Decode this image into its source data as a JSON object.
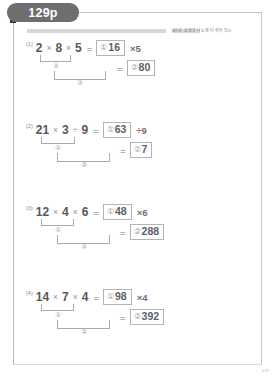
{
  "page": {
    "tab_label": "129p",
    "header_label": "3단원 곱셈과 나눗셈이 섞여 있는 식",
    "page_number": "129"
  },
  "problems": [
    {
      "number": "(1)",
      "terms": [
        "2",
        "8",
        "5"
      ],
      "operators": [
        "×",
        "×"
      ],
      "line1": {
        "equals": "=",
        "marker": "①",
        "answer": "16",
        "tail": "×5"
      },
      "line2": {
        "equals": "=",
        "marker": "②",
        "answer": "80"
      },
      "bracket_inner_label": "①",
      "bracket_outer_label": "②"
    },
    {
      "number": "(2)",
      "terms": [
        "21",
        "3",
        "9"
      ],
      "operators": [
        "×",
        "÷"
      ],
      "line1": {
        "equals": "=",
        "marker": "①",
        "answer": "63",
        "tail": "÷9"
      },
      "line2": {
        "equals": "=",
        "marker": "②",
        "answer": "7"
      },
      "bracket_inner_label": "①",
      "bracket_outer_label": "②"
    },
    {
      "number": "(3)",
      "terms": [
        "12",
        "4",
        "6"
      ],
      "operators": [
        "×",
        "×"
      ],
      "line1": {
        "equals": "=",
        "marker": "①",
        "answer": "48",
        "tail": "×6"
      },
      "line2": {
        "equals": "=",
        "marker": "②",
        "answer": "288"
      },
      "bracket_inner_label": "①",
      "bracket_outer_label": "②"
    },
    {
      "number": "(4)",
      "terms": [
        "14",
        "7",
        "4"
      ],
      "operators": [
        "×",
        "×"
      ],
      "line1": {
        "equals": "=",
        "marker": "①",
        "answer": "98",
        "tail": "×4"
      },
      "line2": {
        "equals": "=",
        "marker": "②",
        "answer": "392"
      },
      "bracket_inner_label": "①",
      "bracket_outer_label": "②"
    }
  ],
  "colors": {
    "tab_bg": "#6e6e6e",
    "band": "#d7d7d7",
    "rule": "#bdbdbd",
    "box_border": "#b4b4b4",
    "text": "#55585c"
  }
}
